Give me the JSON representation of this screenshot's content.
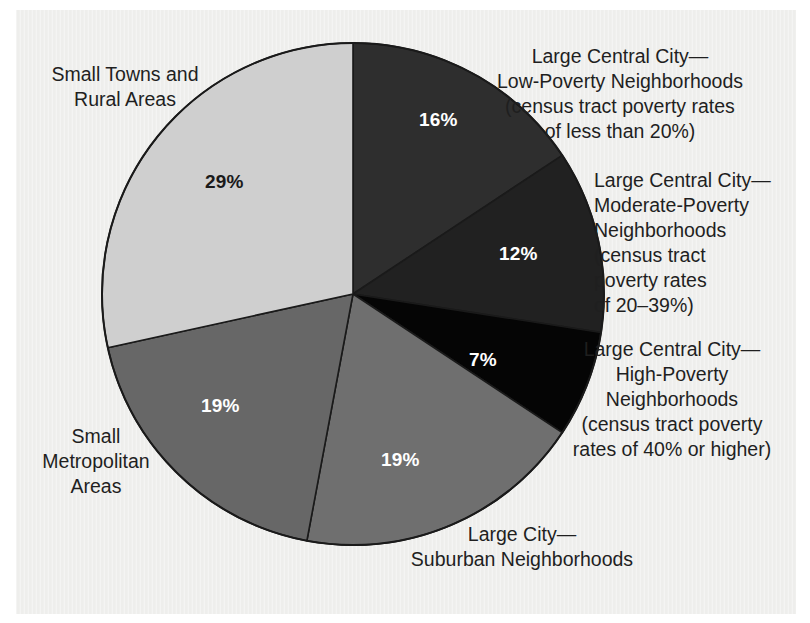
{
  "chart_data": {
    "type": "pie",
    "title": "",
    "subtitle": "",
    "xlabel": "",
    "ylabel": "",
    "legend_position": "callout-labels",
    "grid": false,
    "units": "percent",
    "total": 102,
    "start_angle_deg": 0,
    "direction": "clockwise",
    "categories": [
      "Large Central City—Low-Poverty Neighborhoods (census tract poverty rates of less than 20%)",
      "Large Central City—Moderate-Poverty Neighborhoods (census tract poverty rates of 20–39%)",
      "Large Central City—High-Poverty Neighborhoods (census tract poverty rates of 40% or higher)",
      "Large City—Suburban Neighborhoods",
      "Small Metropolitan Areas",
      "Small Towns and Rural Areas"
    ],
    "values": [
      16,
      12,
      7,
      19,
      19,
      29
    ],
    "value_labels": [
      "16%",
      "12%",
      "7%",
      "19%",
      "19%",
      "29%"
    ],
    "colors": [
      "#2e2e2e",
      "#212121",
      "#050505",
      "#6f6f6f",
      "#676767",
      "#cfcfcf"
    ],
    "slice_label_colors": [
      "#ffffff",
      "#ffffff",
      "#ffffff",
      "#ffffff",
      "#ffffff",
      "#1a1a1a"
    ]
  },
  "pie": {
    "center_x": 353,
    "center_y": 294,
    "radius": 251,
    "outline_color": "#1a1a1a",
    "slices": [
      {
        "name": "large-central-city-low-poverty",
        "value": 16,
        "label": "16%",
        "color": "#2e2e2e",
        "label_x": 419,
        "label_y": 110,
        "label_tone": "light"
      },
      {
        "name": "large-central-city-moderate-poverty",
        "value": 12,
        "label": "12%",
        "color": "#212121",
        "label_x": 499,
        "label_y": 244,
        "label_tone": "light"
      },
      {
        "name": "large-central-city-high-poverty",
        "value": 7,
        "label": "7%",
        "color": "#050505",
        "label_x": 469,
        "label_y": 350,
        "label_tone": "light"
      },
      {
        "name": "large-city-suburban",
        "value": 19,
        "label": "19%",
        "color": "#6f6f6f",
        "label_x": 381,
        "label_y": 450,
        "label_tone": "light"
      },
      {
        "name": "small-metropolitan-areas",
        "value": 19,
        "label": "19%",
        "color": "#676767",
        "label_x": 201,
        "label_y": 396,
        "label_tone": "light"
      },
      {
        "name": "small-towns-and-rural-areas",
        "value": 29,
        "label": "29%",
        "color": "#cfcfcf",
        "label_x": 205,
        "label_y": 172,
        "label_tone": "dark"
      }
    ]
  },
  "labels": {
    "small_towns": "Small Towns and\nRural Areas",
    "low_poverty": "Large Central City—\nLow-Poverty Neighborhoods\n(census tract poverty rates\nof less than 20%)",
    "moderate_poverty": "Large Central City—\nModerate-Poverty\nNeighborhoods\n(census tract\npoverty rates\nof 20–39%)",
    "high_poverty": "Large Central City—\nHigh-Poverty\nNeighborhoods\n(census tract poverty\nrates of 40% or higher)",
    "suburban": "Large City—\nSuburban Neighborhoods",
    "small_metro": "Small\nMetropolitan\nAreas"
  }
}
